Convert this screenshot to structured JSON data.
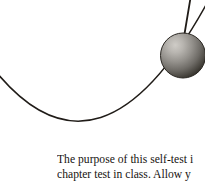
{
  "figure": {
    "name": "pendulum-swing-diagram",
    "background_color": "#ffffff",
    "stroke_color": "#201c18",
    "pendulum": {
      "string": {
        "name": "pendulum-string",
        "top_x": 190,
        "top_y": 0,
        "bottom_x": 184,
        "bottom_y": 36,
        "width": 1.7
      },
      "bob": {
        "name": "pendulum-bob-sphere",
        "center_x": 183,
        "center_y": 55.5,
        "radius": 22.5,
        "highlight_color": "#c8c5c0",
        "mid_color": "#8d8a86",
        "shadow_color": "#38352f",
        "outline_color": "#2a2722"
      }
    },
    "arc": {
      "name": "swing-path-arc",
      "start_x": -2,
      "start_y": 74,
      "end_x": 205,
      "end_y": 6,
      "control_x": 100,
      "control_y": 195,
      "width": 1.5
    }
  },
  "caption": {
    "name": "figure-caption-text",
    "lines": [
      "The purpose of this self-test i",
      "chapter test in class.  Allow y"
    ],
    "color": "#16130f"
  }
}
